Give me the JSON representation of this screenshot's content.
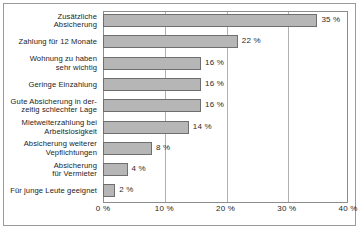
{
  "chart_data": {
    "type": "bar",
    "orientation": "horizontal",
    "title": "",
    "subtitle": "",
    "xlabel": "",
    "ylabel": "",
    "xlim": [
      0,
      40
    ],
    "grid": true,
    "legend": null,
    "xtick_labels": [
      "0 %",
      "10 %",
      "20 %",
      "30 %",
      "40 %"
    ],
    "xtick_values": [
      0,
      10,
      20,
      30,
      40
    ],
    "value_suffix": " %",
    "categories": [
      "Zusätzliche Absicherung",
      "Zahlung für 12 Monate",
      "Wohnung zu haben sehr wichtig",
      "Geringe Einzahlung",
      "Gute Absicherung in derzeitig schlechter Lage",
      "Mietweiterzahlung bei Arbeitslosigkeit",
      "Absicherung weiterer Vepflichtungen",
      "Absicherung für Vermieter",
      "Für junge Leute geeignet"
    ],
    "values": [
      35,
      22,
      16,
      16,
      16,
      14,
      8,
      4,
      2
    ],
    "data_labels": [
      "35 %",
      "22 %",
      "16 %",
      "16 %",
      "16 %",
      "14 %",
      "8 %",
      "4 %",
      "2 %"
    ],
    "colors": {
      "bar_fill": "#b6b6b6",
      "bar_border": "#6f6f6f",
      "gridline": "#b0b0b0",
      "axis": "#8d8d8d",
      "text": "#1c1c1c",
      "background": "#ffffff"
    }
  },
  "category_label_lines": [
    [
      "Zusätzliche",
      "Absicherung"
    ],
    [
      "Zahlung für 12 Monate"
    ],
    [
      "Wohnung zu haben",
      "sehr wichtig"
    ],
    [
      "Geringe Einzahlung"
    ],
    [
      "Gute Absicherung in der-",
      "zeitig schlechter Lage"
    ],
    [
      "Mietweiterzahlung bei",
      "Arbeitslosigkeit"
    ],
    [
      "Absicherung weiterer",
      "Vepflichtungen"
    ],
    [
      "Absicherung",
      "für Vermieter"
    ],
    [
      "Für junge Leute geeignet"
    ]
  ]
}
